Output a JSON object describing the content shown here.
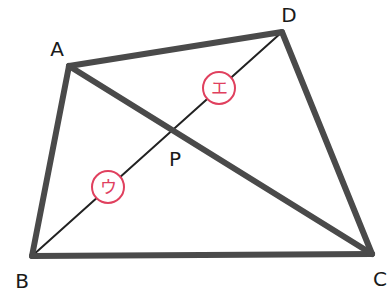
{
  "diagram": {
    "type": "quadrilateral-with-diagonals",
    "colors": {
      "thick_line": "#4a4a4a",
      "thin_line": "#222222",
      "label": "#1a1a1a",
      "circle_accent": "#e0405e",
      "background": "#ffffff"
    },
    "vertices": {
      "A": {
        "label": "A",
        "x": 69,
        "y": 66
      },
      "B": {
        "label": "B",
        "x": 32,
        "y": 256
      },
      "C": {
        "label": "C",
        "x": 372,
        "y": 254
      },
      "D": {
        "label": "D",
        "x": 282,
        "y": 32
      }
    },
    "intersection": {
      "label": "P",
      "x": 174,
      "y": 130
    },
    "edges": [
      {
        "name": "AB",
        "from": "A",
        "to": "B",
        "style": "thick"
      },
      {
        "name": "BC",
        "from": "B",
        "to": "C",
        "style": "thick"
      },
      {
        "name": "CD",
        "from": "C",
        "to": "D",
        "style": "thick"
      },
      {
        "name": "DA",
        "from": "D",
        "to": "A",
        "style": "thick"
      },
      {
        "name": "AC",
        "from": "A",
        "to": "C",
        "style": "thick"
      },
      {
        "name": "BD",
        "from": "B",
        "to": "D",
        "style": "thin"
      }
    ],
    "circled_labels": [
      {
        "name": "e",
        "text": "エ",
        "x": 219,
        "y": 88,
        "r": 16,
        "segment": "PD"
      },
      {
        "name": "u",
        "text": "ウ",
        "x": 108,
        "y": 187,
        "r": 16,
        "segment": "BP"
      }
    ]
  }
}
